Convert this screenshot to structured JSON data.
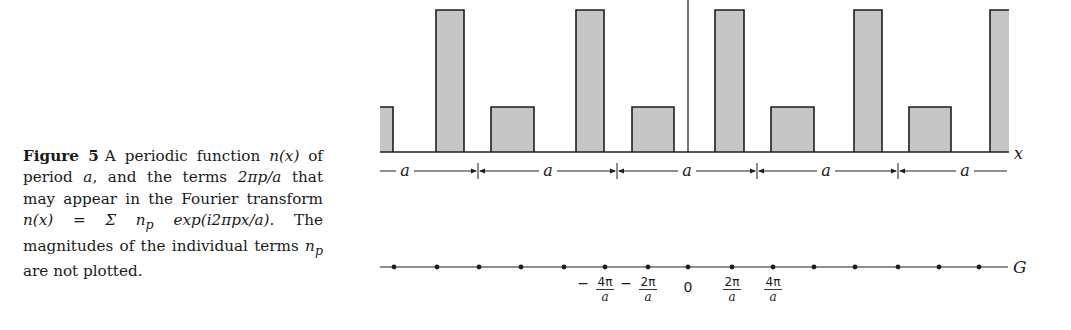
{
  "caption": {
    "figure_label": "Figure 5",
    "line1": "A periodic function ",
    "nx": "n(x)",
    "line1b": " of period ",
    "a": "a",
    "line2": ", and the terms ",
    "term": "2πp/a",
    "line3": " that may appear in the Fourier transform ",
    "transform": "n(x) = Σ n",
    "sub_p": "p",
    "exp": " exp(i2πpx/a)",
    "line4": ". The magnitudes of the individual terms ",
    "np": "n",
    "line5": " are not plotted."
  },
  "colors": {
    "bar_fill": "#c6c6c6",
    "bar_stroke": "#1e1e1e",
    "line": "#1e1e1e",
    "text": "#1a1a1a"
  },
  "chart_data": {
    "type": "diagram",
    "upper_panel": {
      "xlabel": "x",
      "period_label": "a",
      "num_periods_shown": 5,
      "bars": [
        {
          "x0": 380,
          "x1": 393,
          "height": "short"
        },
        {
          "x0": 436,
          "x1": 464,
          "height": "tall"
        },
        {
          "x0": 491,
          "x1": 534,
          "height": "short"
        },
        {
          "x0": 576,
          "x1": 604,
          "height": "tall"
        },
        {
          "x0": 632,
          "x1": 674,
          "height": "short"
        },
        {
          "x0": 715,
          "x1": 744,
          "height": "tall"
        },
        {
          "x0": 771,
          "x1": 814,
          "height": "short"
        },
        {
          "x0": 854,
          "x1": 882,
          "height": "tall"
        },
        {
          "x0": 909,
          "x1": 951,
          "height": "short"
        },
        {
          "x0": 990,
          "x1": 1009,
          "height": "tall"
        }
      ],
      "tall_top_y": 10,
      "short_top_y": 107,
      "baseline_y": 152,
      "origin_x": 688,
      "period_ticks_x": [
        478,
        617,
        757,
        898
      ],
      "period_labels_x": [
        405,
        548,
        687,
        826,
        965
      ]
    },
    "lower_panel": {
      "xlabel": "G",
      "axis_y": 267,
      "points_x": [
        394,
        437,
        479,
        521,
        564,
        605,
        648,
        688,
        732,
        773,
        814,
        855,
        898,
        939,
        979
      ],
      "tick_labels": [
        {
          "x": 605,
          "sign": "−",
          "num": "4π",
          "den": "a"
        },
        {
          "x": 648,
          "sign": "−",
          "num": "2π",
          "den": "a"
        },
        {
          "x": 688,
          "sign": "",
          "num": "0",
          "den": ""
        },
        {
          "x": 732,
          "sign": "",
          "num": "2π",
          "den": "a"
        },
        {
          "x": 773,
          "sign": "",
          "num": "4π",
          "den": "a"
        }
      ]
    }
  },
  "labels": {
    "x_axis": "x",
    "g_axis": "G",
    "period": "a",
    "zero": "0",
    "minus": "−",
    "four_pi": "4π",
    "two_pi": "2π",
    "den": "a"
  }
}
